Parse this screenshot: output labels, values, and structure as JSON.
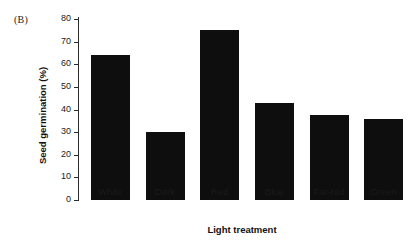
{
  "panel": {
    "label": "(B)"
  },
  "chart_data": {
    "type": "bar",
    "title": "",
    "panel_label": "(B)",
    "xlabel": "Light treatment",
    "ylabel": "Seed germination (%)",
    "categories": [
      "White",
      "Dark",
      "Red",
      "Blue",
      "Far-red",
      "Green"
    ],
    "values": [
      64,
      30,
      75,
      43,
      37.5,
      36
    ],
    "ylim": [
      0,
      80
    ],
    "yticks": [
      0,
      10,
      20,
      30,
      40,
      50,
      60,
      70,
      80
    ],
    "ytick_labels": [
      "0",
      "10",
      "20",
      "30",
      "40",
      "50",
      "60",
      "70",
      "80"
    ],
    "grid": false,
    "legend": "none",
    "bar_color": "#0e0e0e",
    "axis_color": "#2b2b2b",
    "background": "#ffffff"
  }
}
